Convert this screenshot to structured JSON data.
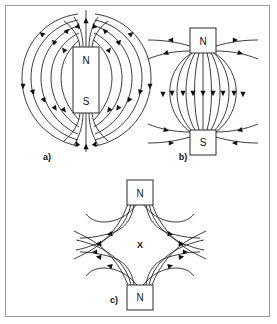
{
  "figure": {
    "background_color": "#ffffff",
    "frame_color": "#9a9a9a",
    "line_color": "#1a1a1a",
    "arrow_color": "#111111"
  },
  "panels": [
    {
      "id": "a",
      "label": "a)",
      "description": "Field of a single bar magnet",
      "magnets": [
        {
          "id": "a-bar",
          "poles": [
            "N",
            "S"
          ],
          "top_label": "N",
          "bottom_label": "S"
        }
      ],
      "neutral_point": null
    },
    {
      "id": "b",
      "label": "b)",
      "description": "Unlike poles facing: attraction",
      "magnets": [
        {
          "id": "b-top",
          "label": "N"
        },
        {
          "id": "b-bottom",
          "label": "S"
        }
      ],
      "neutral_point": null
    },
    {
      "id": "c",
      "label": "c)",
      "description": "Like poles facing: repulsion with neutral point",
      "magnets": [
        {
          "id": "c-top",
          "label": "N"
        },
        {
          "id": "c-bottom",
          "label": "N"
        }
      ],
      "neutral_point": "X"
    }
  ],
  "labels": {
    "panel_a": "a)",
    "panel_b": "b)",
    "panel_c": "c)",
    "a_north": "N",
    "a_south": "S",
    "b_north": "N",
    "b_south": "S",
    "c_north_top": "N",
    "c_north_bottom": "N",
    "c_neutral": "X"
  }
}
